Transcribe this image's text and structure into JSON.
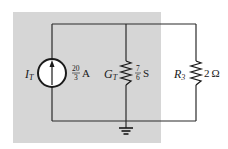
{
  "diagram": {
    "type": "circuit",
    "background_shade_color": "#d6d6d6",
    "wire_color": "#2a2a2a",
    "components": [
      {
        "id": "current-source",
        "kind": "current-source",
        "symbol": "I",
        "subscript": "T",
        "value_numerator": "20",
        "value_denominator": "3",
        "unit": "A",
        "direction": "up"
      },
      {
        "id": "conductance-gt",
        "kind": "resistor",
        "symbol": "G",
        "subscript": "T",
        "value_numerator": "7",
        "value_denominator": "6",
        "unit": "S"
      },
      {
        "id": "resistor-r3",
        "kind": "resistor",
        "symbol": "R",
        "subscript": "3",
        "value": "2",
        "unit": "Ω"
      },
      {
        "id": "ground",
        "kind": "ground"
      }
    ]
  }
}
